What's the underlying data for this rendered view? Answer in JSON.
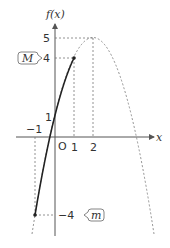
{
  "diagram": {
    "y_axis_label": "f(x)",
    "x_axis_label": "x",
    "origin_label": "O",
    "x_ticks": [
      {
        "value": -1,
        "label": "−1"
      },
      {
        "value": 1,
        "label": "1"
      },
      {
        "value": 2,
        "label": "2"
      }
    ],
    "y_ticks": [
      {
        "value": 5,
        "label": "5"
      },
      {
        "value": 4,
        "label": "4"
      },
      {
        "value": 1,
        "label": "1"
      },
      {
        "value": -4,
        "label": "−4"
      }
    ],
    "function": "f(x) = -(x-2)^2 + 5",
    "vertex": {
      "x": 2,
      "y": 5
    },
    "solid_segment_domain": [
      -1,
      1
    ],
    "endpoints": [
      {
        "x": -1,
        "y": -4
      },
      {
        "x": 1,
        "y": 4
      }
    ],
    "callouts": {
      "max": {
        "label": "M",
        "value": 4
      },
      "min": {
        "label": "m",
        "value": -4
      }
    },
    "colors": {
      "axis": "#555555",
      "curve_solid": "#222222",
      "curve_dashed": "#777777",
      "guide": "#777777"
    }
  }
}
